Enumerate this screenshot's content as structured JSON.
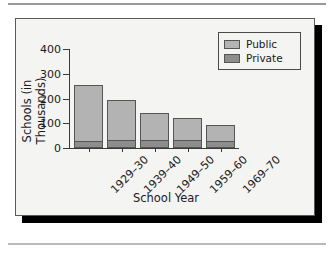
{
  "figure": {
    "background_color": "#f4f4f2",
    "border_color": "#5a5a5a",
    "shadow_color": "#000000"
  },
  "chart_data": {
    "type": "bar",
    "subtype": "stacked",
    "title": "",
    "xlabel": "School Year",
    "ylabel": "Schools (in Thousands)",
    "categories": [
      "1929–30",
      "1939–40",
      "1949–50",
      "1959–60",
      "1969–70"
    ],
    "series": [
      {
        "name": "Public",
        "color": "#b3b3b3",
        "values": [
          228,
          167,
          111,
          92,
          68
        ]
      },
      {
        "name": "Private",
        "color": "#8d8d8d",
        "values": [
          26,
          27,
          30,
          29,
          25
        ]
      }
    ],
    "totals": [
      254,
      194,
      141,
      121,
      93
    ],
    "ylim": [
      0,
      400
    ],
    "yticks": [
      0,
      100,
      200,
      300,
      400
    ],
    "ytick_labels": [
      "0",
      "100",
      "200",
      "300",
      "400"
    ],
    "grid": false,
    "legend_position": "top-right",
    "xtick_label_rotation": -45
  },
  "legend": {
    "items": [
      {
        "label": "Public",
        "color": "#b3b3b3"
      },
      {
        "label": "Private",
        "color": "#8d8d8d"
      }
    ]
  }
}
